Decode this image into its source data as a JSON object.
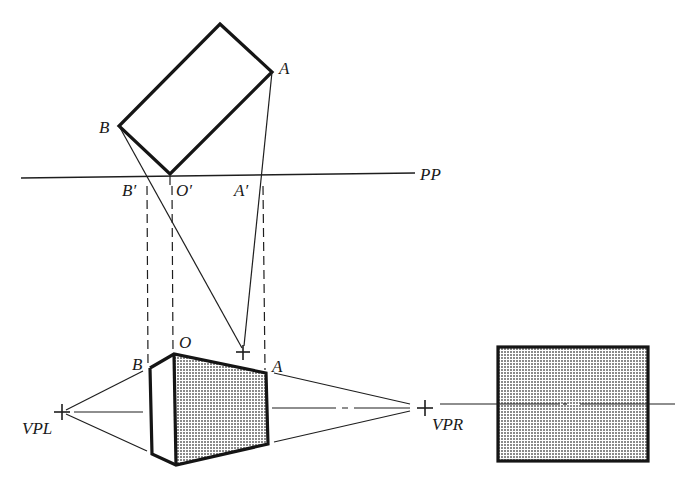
{
  "diagram": {
    "type": "two-point perspective construction",
    "labels": {
      "plan_A": "A",
      "plan_B": "B",
      "picture_plane": "PP",
      "B_prime": "B′",
      "O_prime": "O′",
      "A_prime": "A′",
      "persp_B": "B",
      "persp_O": "O",
      "persp_A": "A",
      "vp_left": "VPL",
      "vp_right": "VPR"
    },
    "colors": {
      "ink": "#151515",
      "shade": "#9a9a9a",
      "background": "#ffffff"
    },
    "elements": [
      "plan-rectangle",
      "picture-plane-line",
      "station-point",
      "projector-lines",
      "dashed-drop-lines",
      "perspective-box",
      "vanishing-point-left",
      "vanishing-point-right",
      "horizon-line",
      "front-elevation-rectangle"
    ]
  }
}
